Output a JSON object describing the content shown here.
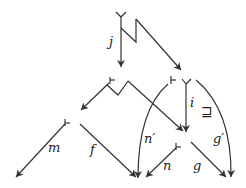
{
  "diagram": {
    "type": "commutative-diagram",
    "colors": {
      "stroke": "#333333",
      "text": "#222222",
      "background": "#ffffff"
    },
    "labels": {
      "j": "j",
      "i": "i",
      "sqsupseteq": "⊒",
      "n_prime": "n′",
      "g_prime": "g′",
      "m": "m",
      "f": "f",
      "n": "n",
      "g": "g"
    },
    "arrows": [
      {
        "label": "j",
        "from": "top",
        "to": "middle-left"
      },
      {
        "label": "",
        "from": "top",
        "to": "middle-right"
      },
      {
        "label": "",
        "from": "middle-left",
        "to": "bottom-left"
      },
      {
        "label": "",
        "from": "middle-left",
        "to": "bottom-right-node"
      },
      {
        "label": "i",
        "from": "middle-right",
        "to": "bottom-right-node"
      },
      {
        "label": "n′",
        "from": "middle-right",
        "to": "bottom-center"
      },
      {
        "label": "g′",
        "from": "middle-right",
        "to": "bottom-right"
      },
      {
        "label": "m",
        "from": "bottom-left-node",
        "to": "bottom-left"
      },
      {
        "label": "f",
        "from": "bottom-left-node",
        "to": "bottom-center"
      },
      {
        "label": "n",
        "from": "bottom-right-node",
        "to": "bottom-center"
      },
      {
        "label": "g",
        "from": "bottom-right-node",
        "to": "bottom-right"
      }
    ]
  }
}
